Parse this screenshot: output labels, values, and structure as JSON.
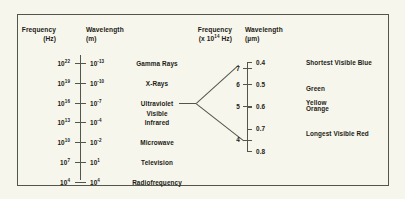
{
  "figure": {
    "background_color": "#f7f6ec",
    "line_color": "#53564a",
    "text_color": "#1b1b16"
  },
  "left_panel": {
    "frequency_header": {
      "line1": "Frequency",
      "line2": "(Hz)"
    },
    "wavelength_header": {
      "line1": "Wavelength",
      "line2": "(m)"
    },
    "rows": [
      {
        "frequency_mantissa": "10",
        "frequency_exponent": "22",
        "wavelength_mantissa": "10",
        "wavelength_exponent": "-13",
        "band": "Gamma Rays"
      },
      {
        "frequency_mantissa": "10",
        "frequency_exponent": "19",
        "wavelength_mantissa": "10",
        "wavelength_exponent": "-10",
        "band": "X-Rays"
      },
      {
        "frequency_mantissa": "10",
        "frequency_exponent": "16",
        "wavelength_mantissa": "10",
        "wavelength_exponent": "-7",
        "band": "Ultraviolet"
      },
      {
        "frequency_mantissa": "10",
        "frequency_exponent": "13",
        "wavelength_mantissa": "10",
        "wavelength_exponent": "-4",
        "band": "Infrared"
      },
      {
        "frequency_mantissa": "10",
        "frequency_exponent": "10",
        "wavelength_mantissa": "10",
        "wavelength_exponent": "-2",
        "band": "Microwave"
      },
      {
        "frequency_mantissa": "10",
        "frequency_exponent": "7",
        "wavelength_mantissa": "10",
        "wavelength_exponent": "1",
        "band": "Television"
      },
      {
        "frequency_mantissa": "10",
        "frequency_exponent": "4",
        "wavelength_mantissa": "10",
        "wavelength_exponent": "4",
        "band": "Radiofrequency"
      }
    ],
    "visible_band_label": "Visible"
  },
  "right_panel": {
    "frequency_header": {
      "line1": "Frequency",
      "line2_prefix": "(x 10",
      "line2_exponent": "14",
      "line2_suffix": " Hz)"
    },
    "wavelength_header": {
      "line1": "Wavelength",
      "line2": "(µm)"
    },
    "frequency_ticks": [
      "7",
      "6",
      "5",
      "4"
    ],
    "wavelength_ticks": [
      "0.4",
      "0.5",
      "0.6",
      "0.7",
      "0.8"
    ],
    "color_labels": [
      "Shortest Visible Blue",
      "Green",
      "Yellow",
      "Orange",
      "Longest Visible Red"
    ]
  },
  "chart_data": {
    "type": "table",
    "panels": [
      {
        "name": "full_spectrum",
        "xlabel": "",
        "ylabel": "Frequency (Hz) / Wavelength (m)",
        "columns": [
          "Frequency (Hz)",
          "Wavelength (m)",
          "Band"
        ],
        "rows": [
          [
            "1e22",
            "1e-13",
            "Gamma Rays"
          ],
          [
            "1e19",
            "1e-10",
            "X-Rays"
          ],
          [
            "1e16",
            "1e-7",
            "Ultraviolet"
          ],
          [
            "1e13",
            "1e-4",
            "Infrared"
          ],
          [
            "1e10",
            "1e-2",
            "Microwave"
          ],
          [
            "1e7",
            "1e1",
            "Television"
          ],
          [
            "1e4",
            "1e4",
            "Radiofrequency"
          ]
        ]
      },
      {
        "name": "visible_spectrum_detail",
        "xlabel": "",
        "ylabel": "Frequency (x 10^14 Hz) / Wavelength (µm)",
        "frequency_values": [
          7,
          6,
          5,
          4
        ],
        "frequency_unit": "x 10^14 Hz",
        "wavelength_values": [
          0.4,
          0.5,
          0.6,
          0.7,
          0.8
        ],
        "wavelength_unit": "µm",
        "color_bands": [
          {
            "label": "Shortest Visible Blue",
            "wavelength_um": 0.4
          },
          {
            "label": "Green",
            "wavelength_um": 0.52
          },
          {
            "label": "Yellow",
            "wavelength_um": 0.58
          },
          {
            "label": "Orange",
            "wavelength_um": 0.61
          },
          {
            "label": "Longest Visible Red",
            "wavelength_um": 0.72
          }
        ]
      }
    ]
  }
}
